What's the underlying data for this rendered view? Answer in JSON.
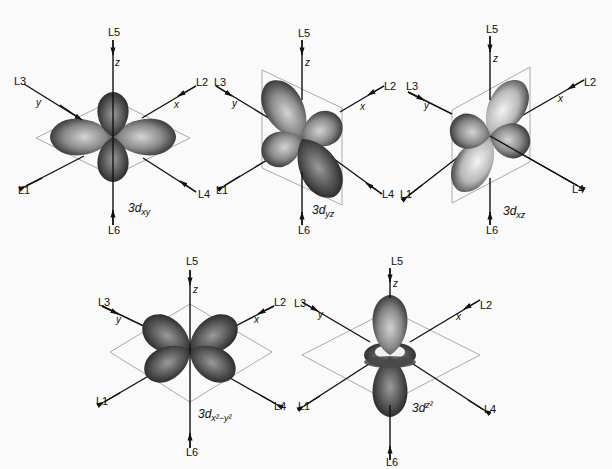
{
  "figure": {
    "ligand_labels": [
      "L1",
      "L2",
      "L3",
      "L4",
      "L5",
      "L6"
    ],
    "axis_labels": {
      "x": "x",
      "y": "y",
      "z": "z"
    },
    "panels": [
      {
        "id": "dxy",
        "caption_main": "3d",
        "caption_sub": "xy",
        "lobe_shade": "medium"
      },
      {
        "id": "dyz",
        "caption_main": "3d",
        "caption_sub": "yz",
        "lobe_shade": "medium"
      },
      {
        "id": "dxz",
        "caption_main": "3d",
        "caption_sub": "xz",
        "lobe_shade": "light"
      },
      {
        "id": "dx2-y2",
        "caption_main": "3d",
        "caption_sub": "x²−y²",
        "lobe_shade": "dark"
      },
      {
        "id": "dz2",
        "caption_main": "3d",
        "caption_sub": "z²",
        "lobe_shade": "dark"
      }
    ]
  },
  "colors": {
    "axis": "#111111",
    "plane": "#aaaaaa",
    "lobe_dark": "#3a3a3a",
    "lobe_light": "#d8d8d8",
    "background": "#fafafa"
  }
}
